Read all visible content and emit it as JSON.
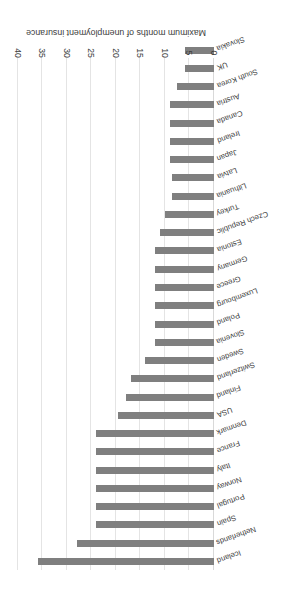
{
  "chart_data": {
    "type": "bar",
    "orientation": "horizontal",
    "title": "",
    "xlabel": "Maximum months of unemployment insurance",
    "ylabel": "",
    "xlim": [
      0,
      40
    ],
    "xticks": [
      0,
      5,
      10,
      15,
      20,
      25,
      30,
      35,
      40
    ],
    "grid": true,
    "legend": false,
    "bar_color": "#7f7f7f",
    "grid_color": "#e4e4e4",
    "text_color": "#3c3c3c",
    "categories": [
      "Iceland",
      "Netherlands",
      "Spain",
      "Portugal",
      "Norway",
      "Italy",
      "France",
      "Denmark",
      "USA",
      "Finland",
      "Switzerland",
      "Sweden",
      "Slovenia",
      "Poland",
      "Luxembourg",
      "Greece",
      "Germany",
      "Estonia",
      "Czech Republic",
      "Turkey",
      "Lithuania",
      "Latvia",
      "Japan",
      "Ireland",
      "Canada",
      "Austria",
      "South Korea",
      "UK",
      "Slovakia"
    ],
    "values": [
      36,
      28,
      24,
      24,
      24,
      24,
      24,
      24,
      19.5,
      18,
      17,
      14,
      12,
      12,
      12,
      12,
      12,
      12,
      11,
      10,
      8.5,
      8.5,
      9,
      9,
      9,
      9,
      7.5,
      6,
      6
    ]
  }
}
